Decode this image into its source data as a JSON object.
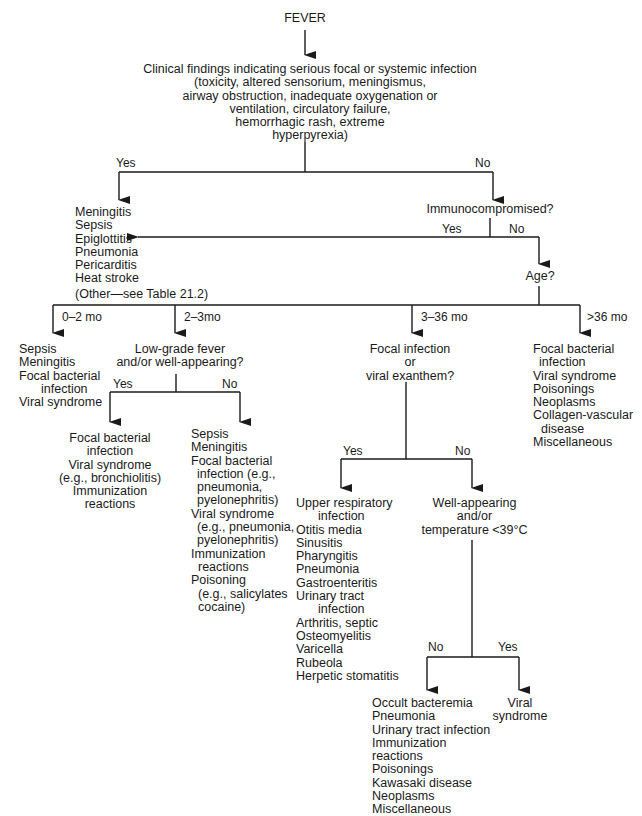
{
  "root": "FEVER",
  "clinical": {
    "title": "Clinical findings indicating serious focal or systemic infection",
    "lines": [
      "(toxicity, altered sensorium, meningismus,",
      "airway obstruction, inadequate oxygenation or",
      "ventilation, circulatory failure,",
      "hemorrhagic rash, extreme",
      "hyperpyrexia)"
    ],
    "yes_label": "Yes",
    "no_label": "No"
  },
  "serious_list": [
    "Meningitis",
    "Sepsis",
    "Epiglottitis",
    "Pneumonia",
    "Pericarditis",
    "Heat stroke",
    "(Other—see Table 21.2)"
  ],
  "immuno": {
    "question": "Immunocompromised?",
    "yes_label": "Yes",
    "no_label": "No"
  },
  "age": {
    "question": "Age?",
    "branches": [
      "0–2 mo",
      "2–3mo",
      "3–36 mo",
      ">36 mo"
    ]
  },
  "age_0_2": [
    "Sepsis",
    "Meningitis",
    "Focal bacterial",
    "infection",
    "Viral syndrome"
  ],
  "age_2_3": {
    "question": [
      "Low-grade fever",
      "and/or well-appearing?"
    ],
    "yes_label": "Yes",
    "no_label": "No",
    "yes_list": [
      "Focal bacterial",
      "infection",
      "Viral syndrome",
      "(e.g., bronchiolitis)",
      "Immunization",
      "reactions"
    ],
    "no_list": [
      "Sepsis",
      "Meningitis",
      "Focal bacterial",
      "infection (e.g.,",
      "pneumonia,",
      "pyelonephritis)",
      "Viral syndrome",
      "(e.g., pneumonia,",
      "pyelonephritis)",
      "Immunization",
      "reactions",
      "Poisoning",
      "(e.g., salicylates",
      "cocaine)"
    ]
  },
  "age_3_36": {
    "question": [
      "Focal infection",
      "or",
      "viral exanthem?"
    ],
    "yes_label": "Yes",
    "no_label": "No",
    "yes_list": [
      "Upper respiratory",
      "infection",
      "Otitis media",
      "Sinusitis",
      "Pharyngitis",
      "Pneumonia",
      "Gastroenteritis",
      "Urinary tract",
      "infection",
      "Arthritis, septic",
      "Osteomyelitis",
      "Varicella",
      "Rubeola",
      "Herpetic stomatitis"
    ],
    "no_question": [
      "Well-appearing",
      "and/or",
      "temperature <39°C"
    ],
    "no_no_label": "No",
    "no_yes_label": "Yes",
    "no_no_list": [
      "Occult bacteremia",
      "Pneumonia",
      "Urinary tract infection",
      "Immunization",
      "reactions",
      "Poisonings",
      "Kawasaki disease",
      "Neoplasms",
      "Miscellaneous"
    ],
    "no_yes_list": [
      "Viral",
      "syndrome"
    ]
  },
  "age_over_36": [
    "Focal bacterial",
    "infection",
    "Viral syndrome",
    "Poisonings",
    "Neoplasms",
    "Collagen-vascular",
    "disease",
    "Miscellaneous"
  ],
  "colors": {
    "ink": "#1a1a1a",
    "background": "#ffffff"
  }
}
